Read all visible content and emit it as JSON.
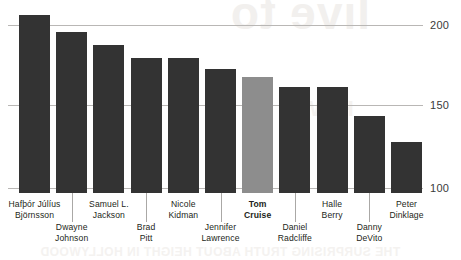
{
  "watermark": {
    "top": "live to",
    "middle": "HOW",
    "bottom": "THE SURPRISING TRUTH ABOUT HEIGHT IN HOLLYWOOD"
  },
  "chart_data": {
    "type": "bar",
    "title": "",
    "subtitle": "",
    "xlabel": "",
    "ylabel": "",
    "ylim": [
      100,
      210
    ],
    "grid": true,
    "gridlines": [
      100,
      150,
      200
    ],
    "ytick_labels": [
      "200",
      "150",
      "100"
    ],
    "legend": "none",
    "highlight_category": "Tom Cruise",
    "colors": {
      "bar": "#333333",
      "bar_highlight": "#8d8d8d",
      "gridline": "#b9b7b5",
      "text": "#231f20",
      "leader": "#aaa8a6",
      "background": "#ffffff"
    },
    "categories": [
      "Hafþór Júlíus Björnsson",
      "Dwayne Johnson",
      "Samuel L. Jackson",
      "Brad Pitt",
      "Nicole Kidman",
      "Jennifer Lawrence",
      "Tom Cruise",
      "Daniel Radcliffe",
      "Halle Berry",
      "Danny DeVito",
      "Peter Dinklage"
    ],
    "values": [
      206,
      196,
      188,
      180,
      180,
      173,
      168,
      162,
      162,
      144,
      128
    ]
  },
  "bars": [
    {
      "label": "Hafþór Júlíus\nBjörnsson",
      "value": 206,
      "highlight": false,
      "row": "upper"
    },
    {
      "label": "Dwayne\nJohnson",
      "value": 196,
      "highlight": false,
      "row": "lower"
    },
    {
      "label": "Samuel L.\nJackson",
      "value": 188,
      "highlight": false,
      "row": "upper"
    },
    {
      "label": "Brad\nPitt",
      "value": 180,
      "highlight": false,
      "row": "lower"
    },
    {
      "label": "Nicole\nKidman",
      "value": 180,
      "highlight": false,
      "row": "upper"
    },
    {
      "label": "Jennifer\nLawrence",
      "value": 173,
      "highlight": false,
      "row": "lower"
    },
    {
      "label": "Tom\nCruise",
      "value": 168,
      "highlight": true,
      "row": "upper"
    },
    {
      "label": "Daniel\nRadcliffe",
      "value": 162,
      "highlight": false,
      "row": "lower"
    },
    {
      "label": "Halle\nBerry",
      "value": 162,
      "highlight": false,
      "row": "upper"
    },
    {
      "label": "Danny\nDeVito",
      "value": 144,
      "highlight": false,
      "row": "lower"
    },
    {
      "label": "Peter\nDinklage",
      "value": 128,
      "highlight": false,
      "row": "upper"
    }
  ],
  "axis": {
    "ticks": [
      {
        "label": "200",
        "y": 25
      },
      {
        "label": "150",
        "y": 105
      },
      {
        "label": "100",
        "y": 188
      }
    ]
  }
}
